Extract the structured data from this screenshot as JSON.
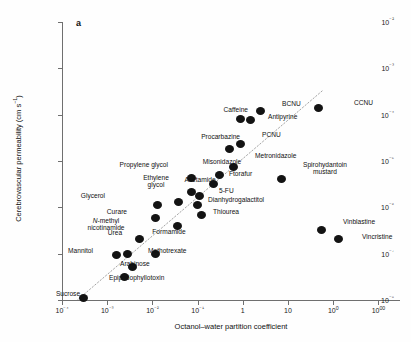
{
  "figure": {
    "panel_label": "a",
    "x_axis_title": "Octanol–water partition coefficient",
    "y_axis_title_main": "Cerebrovascular permeability (cm s",
    "y_axis_title_sup": "−1",
    "y_axis_title_tail": ")"
  },
  "chart_data": {
    "type": "scatter",
    "title": "",
    "xlabel": "Octanol–water partition coefficient",
    "ylabel": "Cerebrovascular permeability (cm s−1)",
    "xscale": "log",
    "yscale": "log",
    "xlim": [
      0.0001,
      3000
    ],
    "ylim": [
      1e-08,
      0.01
    ],
    "grid": false,
    "legend": null,
    "x_ticks": [
      "10⁻⁴",
      "10⁻³",
      "10⁻²",
      "10⁻¹",
      "1",
      "10",
      "100",
      "1000"
    ],
    "x_tick_values": [
      0.0001,
      0.001,
      0.01,
      0.1,
      1,
      10,
      100,
      1000
    ],
    "y_ticks": [
      "10⁻²",
      "10⁻³",
      "10⁻⁴",
      "10⁻⁵",
      "10⁻⁶",
      "10⁻⁷",
      "10⁻⁸"
    ],
    "y_tick_values": [
      0.01,
      0.001,
      0.0001,
      1e-05,
      1e-06,
      1e-07,
      1e-08
    ],
    "trendline": {
      "style": "dotted",
      "x0": 0.00018,
      "y0": 8.5e-09,
      "x1": 60,
      "y1": 0.00034
    },
    "points": [
      {
        "label": "Sucrose",
        "x": 0.0003,
        "y": 1.1e-08,
        "lx": 68,
        "ly": 290,
        "pos": "below"
      },
      {
        "label": "Mannitol",
        "x": 0.0016,
        "y": 9.5e-08,
        "lx": 93,
        "ly": 251,
        "pos": "left"
      },
      {
        "label": "N-methyl\nnicotinamide",
        "x": 0.0028,
        "y": 1e-07,
        "lx": 106,
        "ly": 232,
        "pos": "above",
        "italic_prefix": "N"
      },
      {
        "label": "Epipodophyllotoxin",
        "x": 0.0024,
        "y": 3.2e-08,
        "lx": 109,
        "ly": 278,
        "pos": "right"
      },
      {
        "label": "Arabinose",
        "x": 0.0036,
        "y": 5.2e-08,
        "lx": 120,
        "ly": 264,
        "pos": "right"
      },
      {
        "label": "Methotrexate",
        "x": 0.012,
        "y": 1e-07,
        "lx": 148,
        "ly": 251,
        "pos": "right"
      },
      {
        "label": "Urea",
        "x": 0.0052,
        "y": 2.1e-07,
        "lx": 115,
        "ly": 236,
        "pos": "above"
      },
      {
        "label": "Curare",
        "x": 0.012,
        "y": 6e-07,
        "lx": 127,
        "ly": 212,
        "pos": "left"
      },
      {
        "label": "Glycerol",
        "x": 0.013,
        "y": 1.1e-06,
        "lx": 105,
        "ly": 196,
        "pos": "left"
      },
      {
        "label": "Formamide",
        "x": 0.035,
        "y": 4e-07,
        "lx": 169,
        "ly": 228,
        "pos": "below"
      },
      {
        "label": "Ethylene\nglycol",
        "x": 0.038,
        "y": 1.3e-06,
        "lx": 156,
        "ly": 189,
        "pos": "above"
      },
      {
        "label": "Propylene glycol",
        "x": 0.072,
        "y": 4.2e-06,
        "lx": 168,
        "ly": 165,
        "pos": "left"
      },
      {
        "label": "Thiourea",
        "x": 0.12,
        "y": 7e-07,
        "lx": 213,
        "ly": 212,
        "pos": "right"
      },
      {
        "label": "Dianhydrogalactitol",
        "x": 0.1,
        "y": 1.1e-06,
        "lx": 208,
        "ly": 200,
        "pos": "right"
      },
      {
        "label": "5-FU",
        "x": 0.11,
        "y": 1.8e-06,
        "lx": 219,
        "ly": 191,
        "pos": "right"
      },
      {
        "label": "Acetamide",
        "x": 0.075,
        "y": 2.1e-06,
        "lx": 200,
        "ly": 183,
        "pos": "above"
      },
      {
        "label": "Ftorafur",
        "x": 0.22,
        "y": 3.2e-06,
        "lx": 229,
        "ly": 174,
        "pos": "right"
      },
      {
        "label": "Misonidazole",
        "x": 0.3,
        "y": 5e-06,
        "lx": 222,
        "ly": 165,
        "pos": "above"
      },
      {
        "label": "Metronidazole",
        "x": 0.62,
        "y": 7.5e-06,
        "lx": 255,
        "ly": 156,
        "pos": "right"
      },
      {
        "label": "PCNU",
        "x": 0.88,
        "y": 2.3e-05,
        "lx": 262,
        "ly": 135,
        "pos": "right"
      },
      {
        "label": "Procarbazine",
        "x": 0.5,
        "y": 1.8e-05,
        "lx": 240,
        "ly": 137,
        "pos": "left"
      },
      {
        "label": "Caffeine",
        "x": 0.9,
        "y": 8e-05,
        "lx": 248,
        "ly": 110,
        "pos": "left"
      },
      {
        "label": "Antipyrine",
        "x": 1.5,
        "y": 7.5e-05,
        "lx": 268,
        "ly": 117,
        "pos": "right"
      },
      {
        "label": "BCNU",
        "x": 2.4,
        "y": 0.00012,
        "lx": 282,
        "ly": 104,
        "pos": "right"
      },
      {
        "label": "CCNU",
        "x": 48,
        "y": 0.00014,
        "lx": 354,
        "ly": 103,
        "pos": "right"
      },
      {
        "label": "Spirohydantoin\nmustard",
        "x": 7.0,
        "y": 4e-06,
        "lx": 325,
        "ly": 161,
        "pos": "below"
      },
      {
        "label": "Vinblastine",
        "x": 55,
        "y": 3.2e-07,
        "lx": 343,
        "ly": 222,
        "pos": "right"
      },
      {
        "label": "Vincristine",
        "x": 130,
        "y": 2.1e-07,
        "lx": 362,
        "ly": 237,
        "pos": "right"
      }
    ]
  }
}
